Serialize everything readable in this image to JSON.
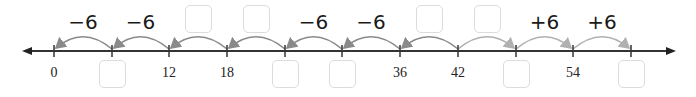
{
  "number_line": {
    "line_y": 51,
    "x_start": 22,
    "x_end": 676,
    "line_color": "#333333",
    "ticks": [
      {
        "x": 54,
        "label": "0",
        "blank": false
      },
      {
        "x": 112,
        "label": "",
        "blank": true
      },
      {
        "x": 169,
        "label": "12",
        "blank": false
      },
      {
        "x": 227,
        "label": "18",
        "blank": false
      },
      {
        "x": 285,
        "label": "",
        "blank": true
      },
      {
        "x": 342,
        "label": "",
        "blank": true
      },
      {
        "x": 400,
        "label": "36",
        "blank": false
      },
      {
        "x": 458,
        "label": "42",
        "blank": false
      },
      {
        "x": 516,
        "label": "",
        "blank": true
      },
      {
        "x": 573,
        "label": "54",
        "blank": false
      },
      {
        "x": 631,
        "label": "",
        "blank": true
      }
    ],
    "jumps": [
      {
        "from": 112,
        "to": 54,
        "label": "−6",
        "blank": false,
        "color": "#8a8a8a"
      },
      {
        "from": 169,
        "to": 112,
        "label": "−6",
        "blank": false,
        "color": "#8a8a8a"
      },
      {
        "from": 227,
        "to": 169,
        "label": "",
        "blank": true,
        "color": "#8a8a8a"
      },
      {
        "from": 285,
        "to": 227,
        "label": "",
        "blank": true,
        "color": "#8a8a8a"
      },
      {
        "from": 342,
        "to": 285,
        "label": "−6",
        "blank": false,
        "color": "#8a8a8a"
      },
      {
        "from": 400,
        "to": 342,
        "label": "−6",
        "blank": false,
        "color": "#8a8a8a"
      },
      {
        "from": 458,
        "to": 400,
        "label": "",
        "blank": true,
        "color": "#8a8a8a"
      },
      {
        "from": 458,
        "to": 516,
        "label": "",
        "blank": true,
        "color": "#b0b0b0"
      },
      {
        "from": 516,
        "to": 573,
        "label": "+6",
        "blank": false,
        "color": "#b0b0b0"
      },
      {
        "from": 573,
        "to": 631,
        "label": "+6",
        "blank": false,
        "color": "#b0b0b0"
      }
    ]
  }
}
